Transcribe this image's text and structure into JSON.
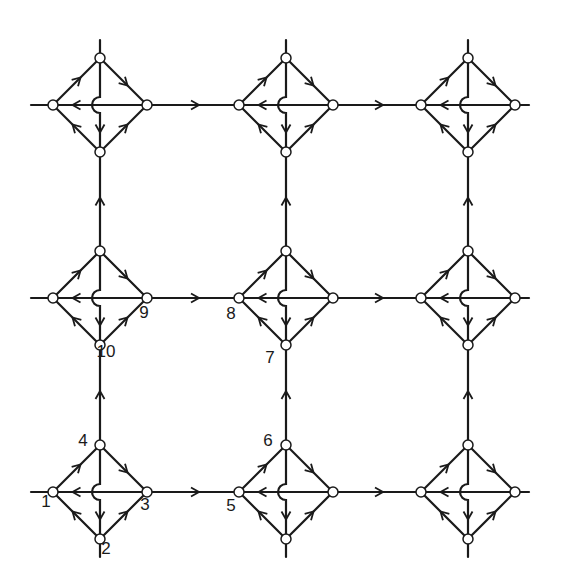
{
  "diagram": {
    "colors": {
      "stroke": "#1a1a1a",
      "node_fill": "#ffffff",
      "background": "#ffffff"
    },
    "grid": {
      "columns_x": [
        100,
        286,
        468
      ],
      "rows_y": [
        105,
        298,
        492
      ],
      "diamond_half_width": 47,
      "diamond_half_height": 47,
      "node_radius": 5
    },
    "labels": [
      {
        "text": "1",
        "x": 46,
        "y": 507
      },
      {
        "text": "2",
        "x": 106,
        "y": 554
      },
      {
        "text": "3",
        "x": 145,
        "y": 510
      },
      {
        "text": "4",
        "x": 83,
        "y": 446
      },
      {
        "text": "5",
        "x": 231,
        "y": 511
      },
      {
        "text": "6",
        "x": 268,
        "y": 446
      },
      {
        "text": "7",
        "x": 270,
        "y": 363
      },
      {
        "text": "8",
        "x": 231,
        "y": 319
      },
      {
        "text": "9",
        "x": 144,
        "y": 318
      },
      {
        "text": "10",
        "x": 106,
        "y": 357
      }
    ],
    "edges_within_diamond": [
      {
        "from": "left",
        "to": "top",
        "directed": true
      },
      {
        "from": "top",
        "to": "right",
        "directed": true
      },
      {
        "from": "right",
        "to": "left",
        "directed": true,
        "note": "horizontal, crossing vertical via hop"
      },
      {
        "from": "top",
        "to": "bottom",
        "directed": true,
        "note": "vertical with semicircle hop at crossing"
      },
      {
        "from": "bottom",
        "to": "left",
        "directed": true
      },
      {
        "from": "bottom",
        "to": "right",
        "directed": true
      }
    ],
    "edges_between_diamonds": [
      {
        "type": "horizontal",
        "direction": "right",
        "note": "right node of diamond to left node of next diamond"
      },
      {
        "type": "vertical",
        "direction": "up",
        "note": "bottom node of upper diamond ... actually top of lower diamond to bottom of upper diamond, arrow pointing up"
      }
    ]
  }
}
